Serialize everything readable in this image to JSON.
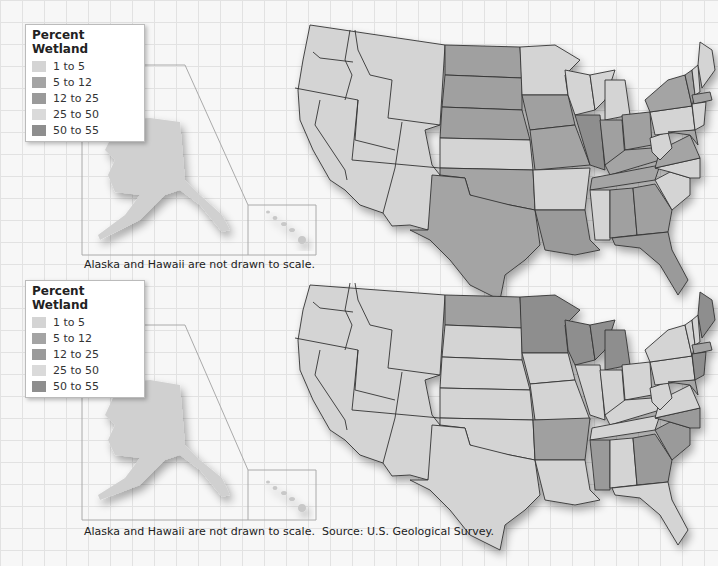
{
  "colors": {
    "c1": "#d4d4d4",
    "c2": "#a4a4a4",
    "c3": "#9a9a9a",
    "c4": "#dadada",
    "c5": "#8e8e8e"
  },
  "maps": [
    {
      "legend": {
        "title": "Percent Wetland",
        "items": [
          {
            "label": "1 to 5"
          },
          {
            "label": "5 to 12"
          },
          {
            "label": "12 to 25"
          },
          {
            "label": "25 to 50"
          },
          {
            "label": "50 to 55"
          }
        ]
      },
      "inset_caption": "Alaska and Hawaii are not drawn to scale."
    },
    {
      "legend": {
        "title": "Percent Wetland",
        "items": [
          {
            "label": "1 to 5"
          },
          {
            "label": "5 to 12"
          },
          {
            "label": "12 to 25"
          },
          {
            "label": "25 to 50"
          },
          {
            "label": "50 to 55"
          }
        ]
      },
      "inset_caption": "Alaska and Hawaii are not drawn to scale.",
      "source": "Source: U.S. Geological Survey."
    }
  ]
}
